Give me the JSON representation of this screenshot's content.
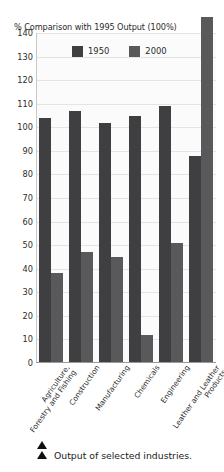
{
  "chart_data": {
    "type": "bar",
    "title": "% Comparison with 1995 Output (100%)",
    "xlabel": "",
    "ylabel": "",
    "ylim": [
      0,
      140
    ],
    "ytick_step": 10,
    "yticks": [
      140,
      130,
      120,
      110,
      100,
      90,
      80,
      70,
      60,
      50,
      40,
      30,
      20,
      10,
      0
    ],
    "grid": true,
    "legend_position": "top-center",
    "categories": [
      "Agriculture, Forestry and Fishing",
      "Construction",
      "Manufacturing",
      "Chemicals",
      "Engineering",
      "Leather and Leather Products"
    ],
    "category_lines": [
      [
        "Agriculture,",
        "Forestry and Fishing"
      ],
      [
        "Construction"
      ],
      [
        "Manufacturing"
      ],
      [
        "Chemicals"
      ],
      [
        "Engineering"
      ],
      [
        "Leather and Leather",
        "Products"
      ]
    ],
    "series": [
      {
        "name": "1950",
        "color": "#3f3f41",
        "values": [
          104,
          107,
          102,
          105,
          109,
          88
        ]
      },
      {
        "name": "2000",
        "color": "#59595c",
        "values": [
          38,
          47,
          45,
          12,
          51,
          147
        ]
      }
    ]
  },
  "caption": {
    "text": "Output of selected industries.",
    "marker_icon": "triangle-up-icon",
    "marker_count": 2
  },
  "colors": {
    "series_1950": "#3f3f41",
    "series_2000": "#59595c",
    "plot_background": "#fbfbfb",
    "gridline": "#e4e4e4",
    "axis": "#9a9a9a",
    "text": "#2b2b2b"
  }
}
